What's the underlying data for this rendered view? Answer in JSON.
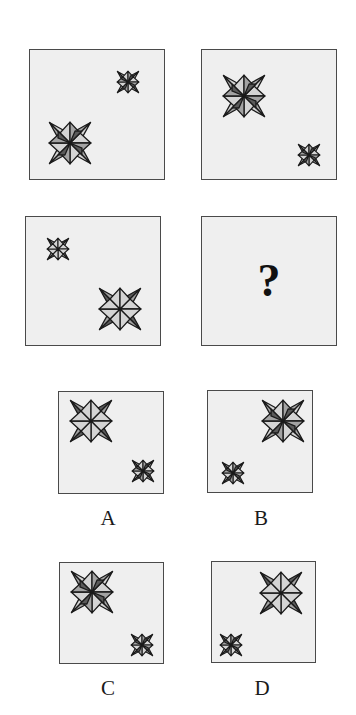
{
  "puzzle": {
    "question_mark": "?",
    "colors": {
      "panel_bg": "#efefef",
      "panel_border": "#4a4a4a",
      "light": "#d4d4d4",
      "mid": "#a3a3a3",
      "dark": "#5a5a5a",
      "outline": "#1a1a1a"
    },
    "panels": [
      {
        "id": "p1",
        "box": [
          29,
          49,
          136,
          131
        ],
        "stars": [
          {
            "size": "small",
            "cx": 128,
            "cy": 82,
            "style": "dark-core"
          },
          {
            "size": "large",
            "cx": 70,
            "cy": 143,
            "style": "dark-core"
          }
        ]
      },
      {
        "id": "p2",
        "box": [
          201,
          49,
          136,
          131
        ],
        "stars": [
          {
            "size": "large",
            "cx": 244,
            "cy": 96,
            "style": "dark-core"
          },
          {
            "size": "small",
            "cx": 309,
            "cy": 155,
            "style": "dark-core"
          }
        ]
      },
      {
        "id": "p3",
        "box": [
          25,
          216,
          136,
          130
        ],
        "stars": [
          {
            "size": "small",
            "cx": 58,
            "cy": 249,
            "style": "dark-tips"
          },
          {
            "size": "large",
            "cx": 120,
            "cy": 309,
            "style": "dark-tips"
          }
        ]
      },
      {
        "id": "p4",
        "box": [
          201,
          216,
          136,
          130
        ],
        "stars": [],
        "question": true
      }
    ],
    "options": [
      {
        "label": "A",
        "box": [
          58,
          391,
          106,
          103
        ],
        "label_pos": [
          108,
          518
        ],
        "stars": [
          {
            "size": "large",
            "cx": 91,
            "cy": 421,
            "style": "dark-tips"
          },
          {
            "size": "small",
            "cx": 143,
            "cy": 471,
            "style": "dark-core"
          }
        ]
      },
      {
        "label": "B",
        "box": [
          207,
          390,
          106,
          103
        ],
        "label_pos": [
          261,
          518
        ],
        "stars": [
          {
            "size": "large",
            "cx": 283,
            "cy": 421,
            "style": "dark-core"
          },
          {
            "size": "small",
            "cx": 233,
            "cy": 473,
            "style": "dark-core"
          }
        ]
      },
      {
        "label": "C",
        "box": [
          59,
          562,
          105,
          102
        ],
        "label_pos": [
          108,
          688
        ],
        "stars": [
          {
            "size": "large",
            "cx": 92,
            "cy": 592,
            "style": "dark-core"
          },
          {
            "size": "small",
            "cx": 142,
            "cy": 645,
            "style": "dark-core"
          }
        ]
      },
      {
        "label": "D",
        "box": [
          211,
          561,
          105,
          102
        ],
        "label_pos": [
          262,
          688
        ],
        "stars": [
          {
            "size": "large",
            "cx": 281,
            "cy": 593,
            "style": "dark-tips"
          },
          {
            "size": "small",
            "cx": 231,
            "cy": 645,
            "style": "dark-core"
          }
        ]
      }
    ]
  }
}
